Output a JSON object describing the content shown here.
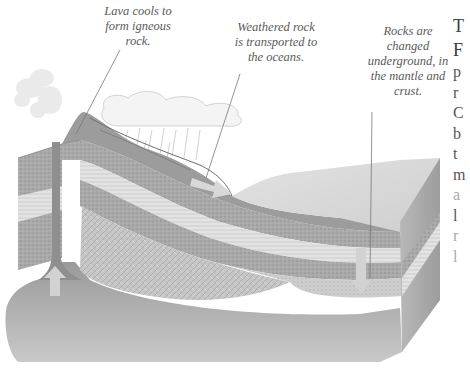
{
  "diagram": {
    "labels": {
      "lava": [
        "Lava cools to",
        "form igneous",
        "rock."
      ],
      "weathered": [
        "Weathered rock",
        "is transported to",
        "the oceans."
      ],
      "rocks": [
        "Rocks are",
        "changed",
        "underground, in",
        "the mantle and",
        "crust."
      ]
    },
    "arrows": [
      {
        "name": "magma-rising",
        "direction": "up"
      },
      {
        "name": "sediment-transport",
        "direction": "right-down"
      },
      {
        "name": "rocks-sinking",
        "direction": "down"
      }
    ],
    "colors": {
      "text": "#5a5a5a",
      "rock_dark": "#8a8a8a",
      "rock_mid": "#a8a8a8",
      "rock_light": "#d6d6d6",
      "arrow": "#d0d0d0"
    }
  },
  "side_text": {
    "heading_lines": [
      "T",
      "F"
    ],
    "body_lines": [
      "p",
      "r",
      "C",
      "b",
      "t",
      "m",
      "a",
      "l",
      "r",
      "l"
    ]
  }
}
